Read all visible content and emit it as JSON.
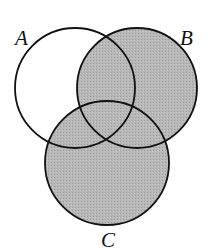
{
  "diagram": {
    "type": "venn",
    "sets": [
      {
        "name": "A",
        "label": "A",
        "cx": 75,
        "cy": 88,
        "r": 60
      },
      {
        "name": "B",
        "label": "B",
        "cx": 137,
        "cy": 88,
        "r": 60
      },
      {
        "name": "C",
        "label": "C",
        "cx": 107,
        "cy": 163,
        "r": 62
      }
    ],
    "shaded_region": "B ∪ C",
    "colors": {
      "shade": "#b4b4b4",
      "stroke": "#111111",
      "background": "#ffffff"
    }
  }
}
